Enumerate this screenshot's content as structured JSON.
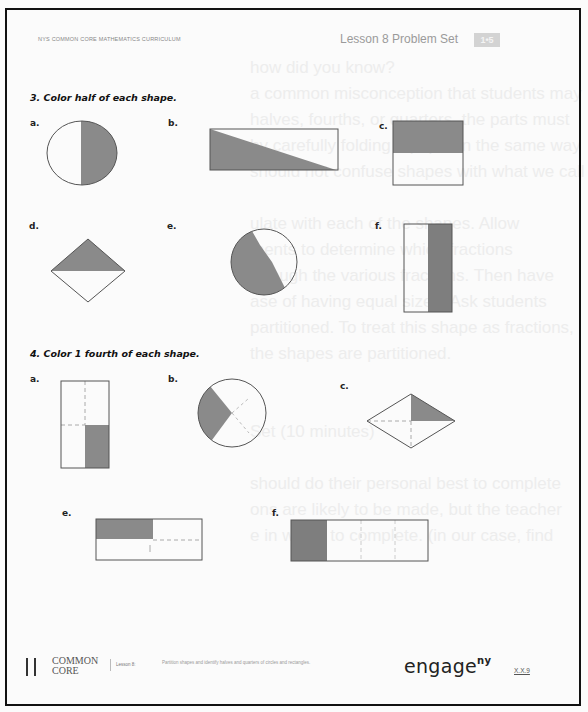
{
  "header": {
    "curriculum": "NYS COMMON CORE MATHEMATICS CURRICULUM",
    "lesson_title": "Lesson 8 Problem Set",
    "grade_badge": "1•5"
  },
  "background_bleed": [
    "how did you know?",
    "a common misconception that students may",
    "halves, fourths, or quarters, the parts must",
    "by carefully folding a paper in the same way",
    "should not confuse shapes with what we call",
    "",
    "ulate with each of the shapes. Allow",
    "ments to determine which fractions",
    "through the various fractions. Then have",
    "ase of having equal sizes. Ask students",
    "partitioned. To treat this shape as fractions,",
    "the shapes are partitioned.",
    "",
    "",
    "Set (10 minutes)",
    "",
    "should do their personal best to complete",
    "ons are likely to be made, but the teacher",
    "e in which to complete. (in our case, find"
  ],
  "question3": {
    "title": "3. Color half of each shape.",
    "items": [
      {
        "label": "a.",
        "shape": "circle",
        "shaded": "right half"
      },
      {
        "label": "b.",
        "shape": "rectangle",
        "shaded": "lower-left triangle (diagonal half)"
      },
      {
        "label": "c.",
        "shape": "square",
        "shaded": "top half"
      },
      {
        "label": "d.",
        "shape": "rhombus",
        "shaded": "top half"
      },
      {
        "label": "e.",
        "shape": "circle",
        "shaded": "left half (diagonal)"
      },
      {
        "label": "f.",
        "shape": "rectangle",
        "shaded": "right half"
      }
    ]
  },
  "question4": {
    "title": "4. Color 1 fourth of each shape.",
    "items": [
      {
        "label": "a.",
        "shape": "rectangle",
        "shaded": "bottom-right quarter"
      },
      {
        "label": "b.",
        "shape": "circle",
        "shaded": "left quarter"
      },
      {
        "label": "c.",
        "shape": "rhombus",
        "shaded": "top-right quarter"
      },
      {
        "label": "e.",
        "shape": "rectangle",
        "shaded": "top-left quarter"
      },
      {
        "label": "f.",
        "shape": "rectangle",
        "shaded": "left quarter (vertical strip)"
      }
    ]
  },
  "footer": {
    "logo_line1": "COMMON",
    "logo_line2": "CORE",
    "lesson": "Lesson 8:",
    "description": "Partition shapes and identify halves and quarters of circles and rectangles.",
    "brand": "engage",
    "brand_sup": "ny",
    "page": "X.X.9"
  },
  "colors": {
    "shade": "#8a8a8a",
    "outline": "#4a4a4a",
    "frame": "#111111"
  }
}
